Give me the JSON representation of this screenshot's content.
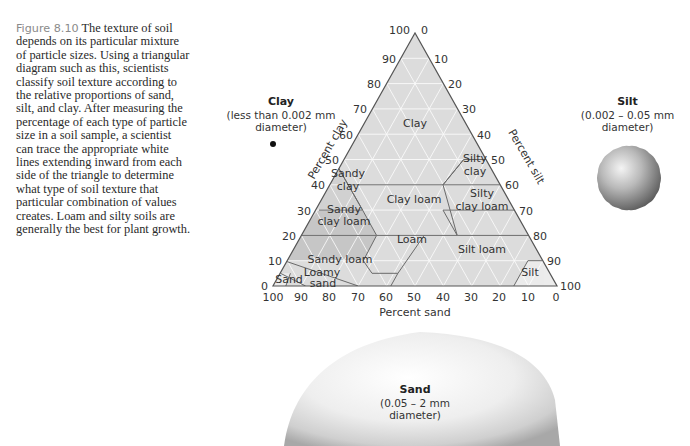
{
  "caption": {
    "figure_label": "Figure 8.10",
    "text": " The texture of soil depends on its particular mixture of particle sizes. Using a triangular diagram such as this, scientists classify soil texture according to the relative proportions of sand, silt, and clay. After measuring the percentage of each type of particle size in a soil sample, a scientist can trace the appropriate white lines extending inward from each side of the triangle to determine what type of soil texture that particular combination of values creates. Loam and silty soils are generally the best for plant growth."
  },
  "particles": {
    "clay": {
      "name": "Clay",
      "size": "(less than 0.002 mm",
      "size2": "diameter)"
    },
    "silt": {
      "name": "Silt",
      "size": "(0.002 – 0.05 mm",
      "size2": "diameter)"
    },
    "sand": {
      "name": "Sand",
      "size": "(0.05 – 2 mm",
      "size2": "diameter)"
    }
  },
  "axes": {
    "clay_title": "Percent clay",
    "silt_title": "Percent silt",
    "sand_title": "Percent sand",
    "clay_ticks": [
      "0",
      "10",
      "20",
      "30",
      "40",
      "50",
      "60",
      "70",
      "80",
      "90",
      "100"
    ],
    "silt_ticks": [
      "0",
      "10",
      "20",
      "30",
      "40",
      "50",
      "60",
      "70",
      "80",
      "90",
      "100"
    ],
    "sand_ticks": [
      "100",
      "90",
      "80",
      "70",
      "60",
      "50",
      "40",
      "30",
      "20",
      "10",
      "0"
    ]
  },
  "regions": {
    "clay": "Clay",
    "silty_clay_1": "Silty",
    "silty_clay_2": "clay",
    "sandy_clay_1": "Sandy",
    "sandy_clay_2": "clay",
    "clay_loam": "Clay loam",
    "silty_clay_loam_1": "Silty",
    "silty_clay_loam_2": "clay loam",
    "sandy_clay_loam_1": "Sandy",
    "sandy_clay_loam_2": "clay loam",
    "loam": "Loam",
    "silt_loam": "Silt loam",
    "sandy_loam": "Sandy loam",
    "loamy_sand_1": "Loamy",
    "loamy_sand_2": "sand",
    "sand": "Sand",
    "silt": "Silt"
  }
}
